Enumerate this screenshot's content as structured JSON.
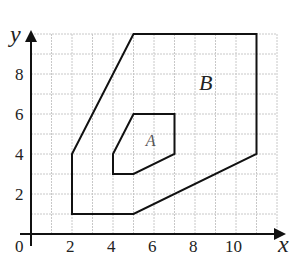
{
  "diagram": {
    "axes": {
      "x_label": "x",
      "y_label": "y",
      "origin_label": "0",
      "x_ticks": [
        "2",
        "4",
        "6",
        "8",
        "10"
      ],
      "y_ticks": [
        "2",
        "4",
        "6",
        "8"
      ],
      "x_range": [
        0,
        11.5
      ],
      "y_range": [
        0,
        10
      ],
      "grid": true,
      "grid_step": 1
    },
    "shapes": [
      {
        "name": "B",
        "label": "B",
        "vertices": [
          [
            2,
            1
          ],
          [
            2,
            4
          ],
          [
            5,
            10
          ],
          [
            11,
            10
          ],
          [
            11,
            4
          ],
          [
            5,
            1
          ]
        ],
        "label_position": [
          8.2,
          7.2
        ]
      },
      {
        "name": "A",
        "label": "A",
        "vertices": [
          [
            4,
            3
          ],
          [
            4,
            4
          ],
          [
            5,
            6
          ],
          [
            7,
            6
          ],
          [
            7,
            4
          ],
          [
            5,
            3
          ]
        ],
        "label_position": [
          5.6,
          4.4
        ]
      }
    ],
    "colors": {
      "line": "#111111",
      "grid": "#c8c8c8",
      "background": "#ffffff"
    }
  }
}
